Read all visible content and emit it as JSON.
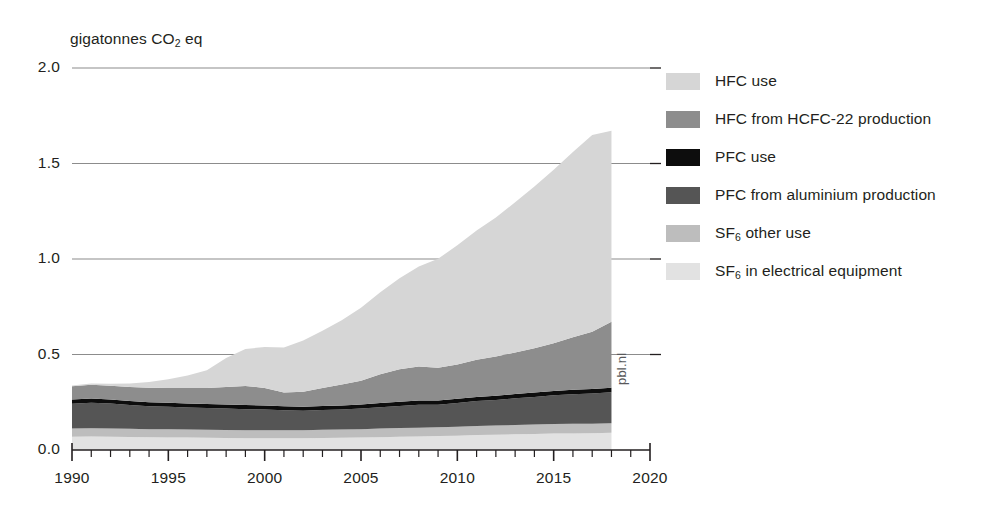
{
  "chart_data": {
    "type": "area",
    "title": "",
    "subtitle": "",
    "xlabel": "",
    "ylabel": "gigatonnes CO2 eq",
    "ylabel_rich": {
      "pre": "gigatonnes CO",
      "sub": "2",
      "post": " eq"
    },
    "xlim": [
      1990,
      2020
    ],
    "ylim": [
      0.0,
      2.0
    ],
    "ytick_labels": [
      "0.0",
      "0.5",
      "1.0",
      "1.5",
      "2.0"
    ],
    "ytick_values": [
      0.0,
      0.5,
      1.0,
      1.5,
      2.0
    ],
    "xtick_labels": [
      "1990",
      "1995",
      "2000",
      "2005",
      "2010",
      "2015",
      "2020"
    ],
    "xtick_values": [
      1990,
      1995,
      2000,
      2005,
      2010,
      2015,
      2020
    ],
    "minor_xtick_step": 1,
    "grid": "horizontal",
    "stacked": true,
    "legend_position": "right",
    "data_end_year": 2018,
    "watermark": "pbl.nl",
    "x": [
      1990,
      1991,
      1992,
      1993,
      1994,
      1995,
      1996,
      1997,
      1998,
      1999,
      2000,
      2001,
      2002,
      2003,
      2004,
      2005,
      2006,
      2007,
      2008,
      2009,
      2010,
      2011,
      2012,
      2013,
      2014,
      2015,
      2016,
      2017,
      2018
    ],
    "series": [
      {
        "name": "SF6 in electrical equipment",
        "name_rich": {
          "pre": "SF",
          "sub": "6",
          "post": " in electrical equipment"
        },
        "color": "#e2e2e2",
        "stack_order": 1,
        "values": [
          0.07,
          0.071,
          0.07,
          0.068,
          0.067,
          0.066,
          0.065,
          0.064,
          0.063,
          0.062,
          0.062,
          0.062,
          0.062,
          0.063,
          0.064,
          0.065,
          0.067,
          0.069,
          0.071,
          0.073,
          0.075,
          0.078,
          0.08,
          0.082,
          0.084,
          0.086,
          0.087,
          0.088,
          0.09
        ]
      },
      {
        "name": "SF6 other use",
        "name_rich": {
          "pre": "SF",
          "sub": "6",
          "post": " other use"
        },
        "color": "#bdbdbd",
        "stack_order": 2,
        "values": [
          0.042,
          0.043,
          0.043,
          0.043,
          0.042,
          0.042,
          0.042,
          0.042,
          0.042,
          0.042,
          0.042,
          0.042,
          0.042,
          0.043,
          0.043,
          0.044,
          0.045,
          0.046,
          0.046,
          0.046,
          0.047,
          0.048,
          0.048,
          0.049,
          0.049,
          0.05,
          0.05,
          0.05,
          0.05
        ]
      },
      {
        "name": "PFC from aluminium production",
        "color": "#555555",
        "stack_order": 3,
        "values": [
          0.13,
          0.134,
          0.13,
          0.124,
          0.12,
          0.118,
          0.116,
          0.114,
          0.112,
          0.11,
          0.108,
          0.104,
          0.102,
          0.103,
          0.105,
          0.108,
          0.112,
          0.116,
          0.12,
          0.118,
          0.124,
          0.13,
          0.134,
          0.14,
          0.145,
          0.15,
          0.155,
          0.158,
          0.162
        ]
      },
      {
        "name": "PFC use",
        "color": "#0d0d0d",
        "stack_order": 4,
        "values": [
          0.022,
          0.022,
          0.021,
          0.021,
          0.021,
          0.021,
          0.021,
          0.021,
          0.021,
          0.021,
          0.021,
          0.021,
          0.021,
          0.021,
          0.021,
          0.021,
          0.022,
          0.022,
          0.022,
          0.022,
          0.022,
          0.022,
          0.022,
          0.022,
          0.023,
          0.023,
          0.023,
          0.023,
          0.024
        ]
      },
      {
        "name": "HFC from HCFC-22 production",
        "color": "#8d8d8d",
        "stack_order": 5,
        "values": [
          0.07,
          0.072,
          0.073,
          0.074,
          0.076,
          0.078,
          0.08,
          0.084,
          0.092,
          0.1,
          0.092,
          0.072,
          0.078,
          0.095,
          0.11,
          0.125,
          0.15,
          0.17,
          0.178,
          0.172,
          0.18,
          0.195,
          0.205,
          0.218,
          0.232,
          0.25,
          0.275,
          0.3,
          0.345
        ]
      },
      {
        "name": "HFC use",
        "color": "#d6d6d6",
        "stack_order": 6,
        "values": [
          0.004,
          0.006,
          0.01,
          0.018,
          0.03,
          0.046,
          0.066,
          0.092,
          0.152,
          0.194,
          0.214,
          0.236,
          0.268,
          0.3,
          0.336,
          0.382,
          0.43,
          0.476,
          0.524,
          0.57,
          0.624,
          0.676,
          0.728,
          0.786,
          0.846,
          0.908,
          0.97,
          1.03,
          1.0
        ]
      }
    ],
    "totals": [
      0.338,
      0.348,
      0.347,
      0.348,
      0.356,
      0.371,
      0.39,
      0.417,
      0.482,
      0.529,
      0.539,
      0.537,
      0.573,
      0.625,
      0.679,
      0.745,
      0.826,
      0.899,
      0.961,
      1.001,
      1.072,
      1.149,
      1.217,
      1.297,
      1.379,
      1.467,
      1.56,
      1.649,
      1.671
    ]
  },
  "legend": {
    "items": [
      {
        "label": "HFC use",
        "color": "#d6d6d6",
        "rich": false
      },
      {
        "label": "HFC from HCFC-22 production",
        "color": "#8d8d8d",
        "rich": false
      },
      {
        "label": "PFC use",
        "color": "#0d0d0d",
        "rich": false
      },
      {
        "label": "PFC from aluminium production",
        "color": "#555555",
        "rich": false
      },
      {
        "label": "SF6 other use",
        "color": "#bdbdbd",
        "rich": true,
        "pre": "SF",
        "sub": "6",
        "post": " other use"
      },
      {
        "label": "SF6 in electrical equipment",
        "color": "#e2e2e2",
        "rich": true,
        "pre": "SF",
        "sub": "6",
        "post": " in electrical equipment"
      }
    ]
  },
  "axis": {
    "unit_pre": "gigatonnes CO",
    "unit_sub": "2",
    "unit_post": " eq"
  },
  "watermark": {
    "text": "pbl.nl"
  },
  "colors": {
    "axis": "#231f20",
    "grid": "#8c8c8c",
    "text": "#231f20"
  }
}
